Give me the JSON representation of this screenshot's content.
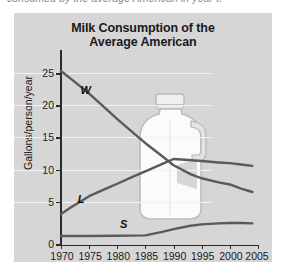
{
  "clipped_caption": "consumed by the average American in year t.",
  "chart_data": {
    "type": "line",
    "title": "Milk Consumption of the",
    "title_line2": "Average American",
    "xlabel": "",
    "ylabel": "Gallons/person/year",
    "xlim": [
      1970,
      2005
    ],
    "ylim": [
      0,
      25
    ],
    "grid": true,
    "legend_position": "inline-labels",
    "x_ticks": [
      1970,
      1975,
      1980,
      1985,
      1990,
      1995,
      2000,
      2005
    ],
    "y_ticks": [
      0,
      5,
      10,
      15,
      20,
      25
    ],
    "annotations": [
      {
        "label": "W",
        "x": 1974.0,
        "y": 22.4
      },
      {
        "label": "L",
        "x": 1973.5,
        "y": 6.6
      },
      {
        "label": "S",
        "x": 1981.0,
        "y": 2.9
      }
    ],
    "watermark": "milk-jug",
    "series": [
      {
        "name": "W",
        "color": "#5a5a5a",
        "x": [
          1970,
          1972,
          1975,
          1978,
          1980,
          1983,
          1985,
          1988,
          1990,
          1993,
          1995,
          1998,
          2000,
          2002,
          2004
        ],
        "values": [
          25.3,
          24.0,
          22.0,
          19.8,
          18.3,
          16.2,
          14.8,
          12.9,
          11.6,
          10.3,
          9.7,
          9.1,
          8.8,
          8.2,
          7.7
        ]
      },
      {
        "name": "L",
        "color": "#5a5a5a",
        "x": [
          1970,
          1972,
          1975,
          1978,
          1980,
          1983,
          1985,
          1988,
          1990,
          1992,
          1995,
          1998,
          2000,
          2002,
          2004
        ],
        "values": [
          4.5,
          5.6,
          7.1,
          8.2,
          8.9,
          10.0,
          10.7,
          11.8,
          12.5,
          12.4,
          12.2,
          12.0,
          11.9,
          11.7,
          11.5
        ]
      },
      {
        "name": "S",
        "color": "#5a5a5a",
        "x": [
          1970,
          1975,
          1980,
          1985,
          1988,
          1990,
          1993,
          1995,
          1998,
          2000,
          2002,
          2004
        ],
        "values": [
          1.3,
          1.3,
          1.35,
          1.4,
          1.9,
          2.3,
          2.8,
          3.0,
          3.15,
          3.2,
          3.2,
          3.15
        ]
      }
    ]
  },
  "colors": {
    "panel_background": "#d6d6d6",
    "gridline": "#f2f2f2",
    "axis": "#2b2b2b",
    "curve": "#5a5a5a",
    "jug_body": "#f7f7f7",
    "jug_outline": "#b6b6b6"
  }
}
